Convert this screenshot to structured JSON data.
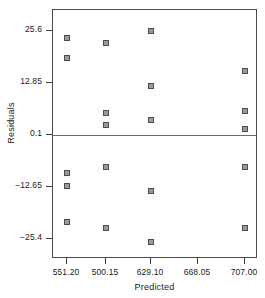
{
  "chart_data": {
    "type": "scatter",
    "title": "",
    "xlabel": "Predicted",
    "ylabel": "Residuals",
    "grid": false,
    "legend": null,
    "xlim": [
      532.0,
      726.5
    ],
    "ylim": [
      -30.4,
      30.7
    ],
    "xticks": [
      551.2,
      500.15,
      629.1,
      668.05,
      707.0
    ],
    "xticklabels": [
      "551.20",
      "500.15",
      "629.10",
      "668.05",
      "707.00"
    ],
    "yticks": [
      25.6,
      12.85,
      0.1,
      -12.65,
      -25.4
    ],
    "yticklabels": [
      "25.6",
      "12.85",
      "0.1",
      "-12.65",
      "-25.4"
    ],
    "reference_line": {
      "axis": "y",
      "value": 0.1
    },
    "marker": {
      "shape": "square",
      "fill": "#9a9a9a",
      "edge": "#4d4d4d",
      "size": 6
    },
    "points": [
      {
        "x": 551.2,
        "y": 23.8
      },
      {
        "x": 551.2,
        "y": 18.9
      },
      {
        "x": 551.2,
        "y": -9.3
      },
      {
        "x": 551.2,
        "y": -12.4
      },
      {
        "x": 551.2,
        "y": -21.2
      },
      {
        "x": 500.15,
        "y": 22.5
      },
      {
        "x": 500.15,
        "y": 5.5
      },
      {
        "x": 500.15,
        "y": 2.6
      },
      {
        "x": 500.15,
        "y": -7.9
      },
      {
        "x": 500.15,
        "y": -22.7
      },
      {
        "x": 629.1,
        "y": 25.6
      },
      {
        "x": 629.1,
        "y": 12.0
      },
      {
        "x": 629.1,
        "y": 3.6
      },
      {
        "x": 629.1,
        "y": -13.8
      },
      {
        "x": 629.1,
        "y": -26.3
      },
      {
        "x": 707.0,
        "y": 15.8
      },
      {
        "x": 707.0,
        "y": 6.0
      },
      {
        "x": 707.0,
        "y": 1.4
      },
      {
        "x": 707.0,
        "y": -7.9
      },
      {
        "x": 707.0,
        "y": -22.7
      }
    ]
  },
  "axes": {
    "x_title": "Predicted",
    "y_title": "Residuals"
  }
}
